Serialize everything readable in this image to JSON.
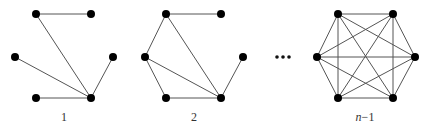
{
  "diagram": {
    "title": "",
    "node_color": "#000000",
    "edge_color": "#555555",
    "node_radius": 4,
    "vertex_positions": {
      "TL": [
        0,
        0
      ],
      "TR": [
        55,
        0
      ],
      "ML": [
        -21,
        43
      ],
      "MR": [
        77,
        43
      ],
      "BL": [
        0,
        84
      ],
      "BR": [
        55,
        84
      ]
    },
    "graphs": [
      {
        "label": "1",
        "origin": [
          36,
          14
        ],
        "label_pos": [
          64,
          121
        ],
        "edges": [
          [
            "TL",
            "TR"
          ],
          [
            "TL",
            "BR"
          ],
          [
            "ML",
            "BR"
          ],
          [
            "BL",
            "BR"
          ],
          [
            "MR",
            "BR"
          ]
        ]
      },
      {
        "label": "2",
        "origin": [
          166,
          14
        ],
        "label_pos": [
          194,
          121
        ],
        "edges": [
          [
            "TL",
            "TR"
          ],
          [
            "TL",
            "ML"
          ],
          [
            "TL",
            "BR"
          ],
          [
            "ML",
            "BR"
          ],
          [
            "ML",
            "BL"
          ],
          [
            "BL",
            "BR"
          ],
          [
            "MR",
            "BR"
          ]
        ]
      },
      {
        "label_var": "n",
        "label_rest": "−1",
        "origin": [
          338,
          14
        ],
        "label_pos": [
          365,
          121
        ],
        "edges": [
          [
            "TL",
            "TR"
          ],
          [
            "TL",
            "ML"
          ],
          [
            "TL",
            "MR"
          ],
          [
            "TL",
            "BL"
          ],
          [
            "TL",
            "BR"
          ],
          [
            "TR",
            "ML"
          ],
          [
            "TR",
            "MR"
          ],
          [
            "TR",
            "BL"
          ],
          [
            "TR",
            "BR"
          ],
          [
            "ML",
            "MR"
          ],
          [
            "ML",
            "BL"
          ],
          [
            "ML",
            "BR"
          ],
          [
            "MR",
            "BL"
          ],
          [
            "MR",
            "BR"
          ],
          [
            "BL",
            "BR"
          ]
        ]
      }
    ],
    "ellipsis": {
      "text": "...",
      "dots": [
        [
          277,
          57
        ],
        [
          283,
          57
        ],
        [
          289,
          57
        ]
      ]
    }
  }
}
